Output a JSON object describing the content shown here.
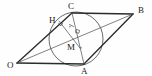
{
  "figure": {
    "type": "geometry-diagram",
    "canvas": {
      "width": 152,
      "height": 76,
      "background": "#fefefe"
    },
    "colors": {
      "stroke_main": "#2b2b2b",
      "stroke_thin": "#4a4a4a",
      "stroke_circle": "#3a3a3a",
      "label": "#1a1a1a"
    },
    "points": [
      {
        "id": "O",
        "label": "O",
        "x": 17,
        "y": 63,
        "label_x": 7,
        "label_y": 68,
        "role": "vertex-bottom-left"
      },
      {
        "id": "A",
        "label": "A",
        "x": 84,
        "y": 64,
        "label_x": 81,
        "label_y": 74,
        "role": "vertex-bottom-right"
      },
      {
        "id": "B",
        "label": "B",
        "x": 133,
        "y": 14,
        "label_x": 138,
        "label_y": 13,
        "role": "vertex-top-right"
      },
      {
        "id": "C",
        "label": "C",
        "x": 72,
        "y": 13,
        "label_x": 68,
        "label_y": 9,
        "role": "vertex-top-left"
      },
      {
        "id": "H",
        "label": "H",
        "x": 59,
        "y": 21,
        "label_x": 49,
        "label_y": 23,
        "role": "foot-of-perpendicular"
      },
      {
        "id": "M",
        "label": "M",
        "x": 76,
        "y": 46,
        "label_x": 67,
        "label_y": 50,
        "role": "intersection-of-diagonals"
      }
    ],
    "segments": [
      {
        "id": "OA",
        "from": "O",
        "to": "A",
        "weight": "main"
      },
      {
        "id": "AB",
        "from": "A",
        "to": "B",
        "weight": "main"
      },
      {
        "id": "BC",
        "from": "B",
        "to": "C",
        "weight": "main"
      },
      {
        "id": "CO",
        "from": "C",
        "to": "O",
        "weight": "main"
      },
      {
        "id": "OB",
        "from": "O",
        "to": "B",
        "weight": "thin"
      },
      {
        "id": "CA",
        "from": "C",
        "to": "A",
        "weight": "thin"
      },
      {
        "id": "HM",
        "from": "H",
        "to": "M",
        "weight": "thin"
      }
    ],
    "circle": {
      "id": "inscribed-circle",
      "cx": 76,
      "cy": 39,
      "r": 27
    },
    "marks": [
      {
        "id": "right-angle-at-H",
        "type": "right-angle-square",
        "x": 61,
        "y": 23
      },
      {
        "id": "right-angle-on-CA",
        "type": "right-angle-square",
        "x": 79,
        "y": 31
      },
      {
        "id": "tick-HM",
        "type": "tick",
        "x": 72,
        "y": 26
      },
      {
        "id": "tick-M",
        "type": "tick",
        "x": 80,
        "y": 47
      }
    ],
    "tick_labels": [
      {
        "id": "tick-label-upper",
        "text": "×",
        "x": 70,
        "y": 28
      },
      {
        "id": "tick-label-lower",
        "text": "×",
        "x": 79,
        "y": 49
      }
    ]
  }
}
